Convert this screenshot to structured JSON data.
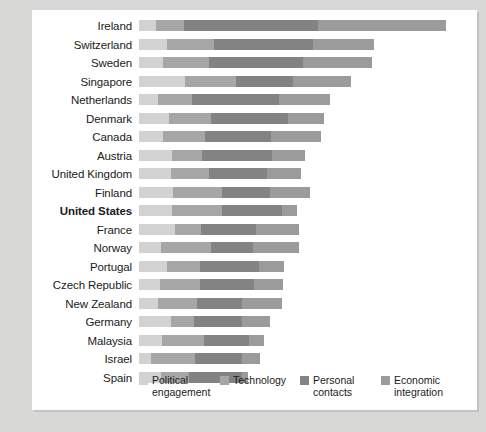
{
  "chart_data": {
    "type": "bar",
    "subtype": "stacked-horizontal-bar",
    "title": "",
    "xlabel": "",
    "ylabel": "",
    "grid": false,
    "legend_position": "bottom",
    "axis_visible": false,
    "categories": [
      "Ireland",
      "Switzerland",
      "Sweden",
      "Singapore",
      "Netherlands",
      "Denmark",
      "Canada",
      "Austria",
      "United Kingdom",
      "Finland",
      "United States",
      "France",
      "Norway",
      "Portugal",
      "Czech Republic",
      "New Zealand",
      "Germany",
      "Malaysia",
      "Israel",
      "Spain"
    ],
    "series": [
      {
        "name": "Political engagement",
        "color": "#d2d2d2",
        "values": [
          5.6,
          9.4,
          8.1,
          15.4,
          6.4,
          10.1,
          8.1,
          11.2,
          10.8,
          11.5,
          11.1,
          12.0,
          7.4,
          9.5,
          7.2,
          6.4,
          10.6,
          7.7,
          3.9,
          7.3
        ]
      },
      {
        "name": "Technology",
        "color": "#a6a6a6",
        "values": [
          9.4,
          15.6,
          15.3,
          17.1,
          11.5,
          14.0,
          14.2,
          10.0,
          12.8,
          16.2,
          16.9,
          8.9,
          16.6,
          11.1,
          13.4,
          12.9,
          7.9,
          14.1,
          15.0,
          9.4
        ]
      },
      {
        "name": "Personal contacts",
        "color": "#838383",
        "values": [
          45.1,
          33.5,
          31.6,
          19.3,
          29.0,
          25.9,
          22.1,
          23.4,
          19.3,
          16.4,
          19.9,
          18.5,
          14.1,
          19.6,
          18.1,
          15.3,
          16.1,
          15.2,
          15.5,
          18.0
        ]
      },
      {
        "name": "Economic integration",
        "color": "#9b9b9b",
        "values": [
          43.0,
          20.2,
          23.1,
          19.4,
          17.2,
          11.9,
          16.5,
          11.1,
          11.4,
          13.1,
          5.2,
          14.1,
          15.7,
          8.6,
          9.5,
          13.3,
          9.3,
          4.9,
          6.3,
          1.8
        ]
      }
    ],
    "xlim": [
      0,
      110
    ],
    "legend": [
      {
        "label": "Political\nengagement",
        "color": "#d2d2d2"
      },
      {
        "label": "Technology",
        "color": "#a6a6a6"
      },
      {
        "label": "Personal\ncontacts",
        "color": "#838383"
      },
      {
        "label": "Economic\nintegration",
        "color": "#9b9b9b"
      }
    ],
    "highlighted_category": "United States",
    "footnote": ""
  },
  "colors": {
    "background": "#d8d8d6",
    "card": "#ffffff",
    "text": "#1b1b1b"
  }
}
